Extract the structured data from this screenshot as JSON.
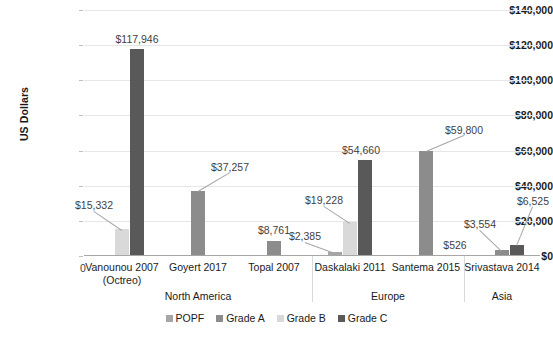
{
  "chart_data": {
    "type": "bar",
    "title": "",
    "xlabel": "",
    "ylabel": "US Dollars",
    "ylim": [
      0,
      140000
    ],
    "ytick_labels": [
      "$0",
      "$20,000",
      "$40,000",
      "$60,000",
      "$80,000",
      "$100,000",
      "$120,000",
      "$140,000"
    ],
    "ytick_values": [
      0,
      20000,
      40000,
      60000,
      80000,
      100000,
      120000,
      140000
    ],
    "grid": true,
    "legend_position": "bottom",
    "categories": [
      "Vanounou 2007 (Octreo)",
      "Goyert 2017",
      "Topal 2007",
      "Daskalaki 2011",
      "Santema 2015",
      "Srivastava 2014"
    ],
    "category_lines": [
      [
        "Vanounou 2007",
        "(Octreo)"
      ],
      [
        "Goyert 2017"
      ],
      [
        "Topal 2007"
      ],
      [
        "Daskalaki 2011"
      ],
      [
        "Santema 2015"
      ],
      [
        "Srivastava 2014"
      ]
    ],
    "groups": [
      {
        "label": "North America",
        "categories": [
          "Vanounou 2007 (Octreo)",
          "Goyert 2017",
          "Topal 2007"
        ]
      },
      {
        "label": "Europe",
        "categories": [
          "Daskalaki 2011",
          "Santema 2015"
        ]
      },
      {
        "label": "Asia",
        "categories": [
          "Srivastava 2014"
        ]
      }
    ],
    "series": [
      {
        "name": "POPF",
        "color": "#a6a6a6",
        "values": [
          0,
          null,
          null,
          2385,
          null,
          526
        ]
      },
      {
        "name": "Grade A",
        "color": "#8c8c8c",
        "values": [
          null,
          37257,
          8761,
          null,
          59800,
          3554
        ]
      },
      {
        "name": "Grade B",
        "color": "#d9d9d9",
        "values": [
          15332,
          null,
          null,
          19228,
          null,
          null
        ]
      },
      {
        "name": "Grade C",
        "color": "#595959",
        "values": [
          117946,
          null,
          null,
          54660,
          null,
          6525
        ]
      }
    ],
    "data_labels": [
      {
        "text": "0",
        "value": 0,
        "category": "Vanounou 2007 (Octreo)",
        "series": "POPF"
      },
      {
        "text": "$15,332",
        "value": 15332,
        "category": "Vanounou 2007 (Octreo)",
        "series": "Grade B"
      },
      {
        "text": "$117,946",
        "value": 117946,
        "category": "Vanounou 2007 (Octreo)",
        "series": "Grade C"
      },
      {
        "text": "$37,257",
        "value": 37257,
        "category": "Goyert 2017",
        "series": "Grade A"
      },
      {
        "text": "$8,761",
        "value": 8761,
        "category": "Topal 2007",
        "series": "Grade A"
      },
      {
        "text": "$2,385",
        "value": 2385,
        "category": "Daskalaki 2011",
        "series": "POPF"
      },
      {
        "text": "$19,228",
        "value": 19228,
        "category": "Daskalaki 2011",
        "series": "Grade B"
      },
      {
        "text": "$54,660",
        "value": 54660,
        "category": "Daskalaki 2011",
        "series": "Grade C"
      },
      {
        "text": "$59,800",
        "value": 59800,
        "category": "Santema 2015",
        "series": "Grade A"
      },
      {
        "text": "$526",
        "value": 526,
        "category": "Srivastava 2014",
        "series": "POPF"
      },
      {
        "text": "$3,554",
        "value": 3554,
        "category": "Srivastava 2014",
        "series": "Grade A"
      },
      {
        "text": "$6,525",
        "value": 6525,
        "category": "Srivastava 2014",
        "series": "Grade C"
      }
    ],
    "legend": [
      {
        "label": "POPF",
        "color": "#a6a6a6"
      },
      {
        "label": "Grade A",
        "color": "#8c8c8c"
      },
      {
        "label": "Grade B",
        "color": "#d9d9d9"
      },
      {
        "label": "Grade C",
        "color": "#595959"
      }
    ]
  }
}
